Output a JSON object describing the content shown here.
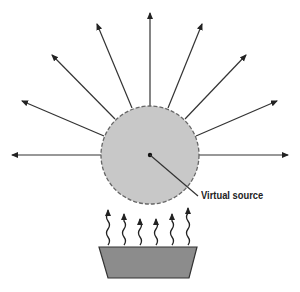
{
  "diagram": {
    "label": "Virtual source",
    "colors": {
      "sphere_fill": "#c8c8c8",
      "sphere_stroke": "#666666",
      "source_fill": "#8c8c8c",
      "line": "#222222"
    }
  }
}
